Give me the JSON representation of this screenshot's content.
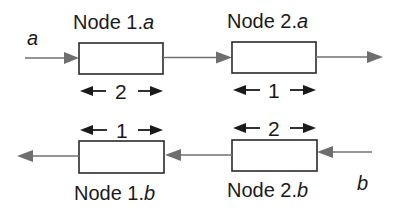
{
  "diagram": {
    "nodes": [
      {
        "id": "node-1a",
        "label_prefix": "Node 1.",
        "label_suffix": "a",
        "dimension": "2"
      },
      {
        "id": "node-2a",
        "label_prefix": "Node 2.",
        "label_suffix": "a",
        "dimension": "1"
      },
      {
        "id": "node-1b",
        "label_prefix": "Node 1.",
        "label_suffix": "b",
        "dimension": "1"
      },
      {
        "id": "node-2b",
        "label_prefix": "Node 2.",
        "label_suffix": "b",
        "dimension": "2"
      }
    ],
    "inputs": {
      "a": "a",
      "b": "b"
    },
    "colors": {
      "box_stroke": "#2a2a2a",
      "flow_arrow": "#707070",
      "dimension_arrow": "#1a1a1a",
      "text": "#1a1a1a"
    }
  }
}
